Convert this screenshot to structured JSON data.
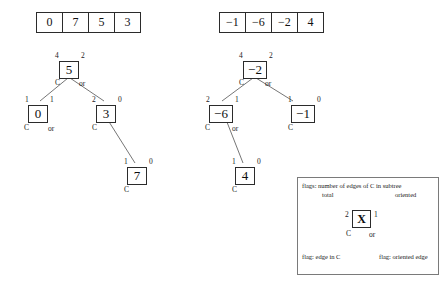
{
  "arrays": [
    {
      "name": "left-array",
      "values": [
        "0",
        "7",
        "5",
        "3"
      ]
    },
    {
      "name": "right-array",
      "values": [
        "−1",
        "−6",
        "−2",
        "4"
      ]
    }
  ],
  "trees": [
    {
      "name": "left-tree",
      "nodes": [
        {
          "id": "l-root",
          "value": "5",
          "flag_total": "4",
          "flag_oriented": "2",
          "flag_c": "C",
          "flag_or": "or"
        },
        {
          "id": "l-left",
          "value": "0",
          "flag_total": "1",
          "flag_oriented": "1",
          "flag_c": "C",
          "flag_or": "or"
        },
        {
          "id": "l-right",
          "value": "3",
          "flag_total": "2",
          "flag_oriented": "0",
          "flag_c": "C",
          "flag_or": ""
        },
        {
          "id": "l-leaf",
          "value": "7",
          "flag_total": "1",
          "flag_oriented": "0",
          "flag_c": "C",
          "flag_or": ""
        }
      ]
    },
    {
      "name": "right-tree",
      "nodes": [
        {
          "id": "r-root",
          "value": "−2",
          "flag_total": "4",
          "flag_oriented": "2",
          "flag_c": "C",
          "flag_or": "or"
        },
        {
          "id": "r-left",
          "value": "−6",
          "flag_total": "2",
          "flag_oriented": "1",
          "flag_c": "C",
          "flag_or": "or"
        },
        {
          "id": "r-right",
          "value": "−1",
          "flag_total": "1",
          "flag_oriented": "0",
          "flag_c": "C",
          "flag_or": ""
        },
        {
          "id": "r-leaf",
          "value": "4",
          "flag_total": "1",
          "flag_oriented": "0",
          "flag_c": "C",
          "flag_or": ""
        }
      ]
    }
  ],
  "legend": {
    "heading": "flags: number of edges of C in subtree",
    "label_total": "total",
    "label_oriented": "oriented",
    "node_value": "X",
    "node_flag_total": "2",
    "node_flag_oriented": "1",
    "node_flag_c": "C",
    "node_flag_or": "or",
    "label_edge_in_c": "flag: edge in C",
    "label_oriented_edge": "flag: oriented edge"
  },
  "colors": {
    "stroke": "#2b2b2b",
    "edge": "#555555",
    "legend_border": "#7a7a7a",
    "background": "#ffffff"
  }
}
